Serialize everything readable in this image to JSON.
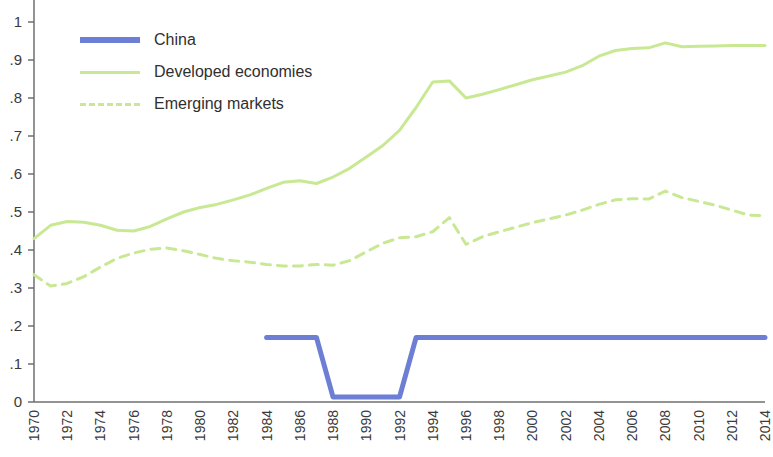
{
  "chart_data": {
    "type": "line",
    "title": "",
    "subtitle": "",
    "xlabel": "",
    "ylabel": "",
    "xlim": [
      1970,
      2014
    ],
    "ylim": [
      0,
      1
    ],
    "grid": false,
    "legend_position": "top-left",
    "y_ticks": [
      "0",
      "0.1",
      "0.2",
      "0.3",
      "0.4",
      "0.5",
      "0.6",
      "0.7",
      "0.8",
      "0.9",
      "1"
    ],
    "y_tick_labels_visible": [
      "0",
      ".1",
      ".2",
      ".3",
      ".4",
      ".5",
      ".6",
      ".7",
      ".8",
      ".9",
      "1"
    ],
    "y_tick_values": [
      0,
      0.1,
      0.2,
      0.3,
      0.4,
      0.5,
      0.6,
      0.7,
      0.8,
      0.9,
      1
    ],
    "x_tick_labels": [
      "1970",
      "1972",
      "1974",
      "1976",
      "1978",
      "1980",
      "1982",
      "1984",
      "1986",
      "1988",
      "1990",
      "1992",
      "1994",
      "1996",
      "1998",
      "2000",
      "2002",
      "2004",
      "2006",
      "2008",
      "2010",
      "2012",
      "2014"
    ],
    "x_tick_values": [
      1970,
      1972,
      1974,
      1976,
      1978,
      1980,
      1982,
      1984,
      1986,
      1988,
      1990,
      1992,
      1994,
      1996,
      1998,
      2000,
      2002,
      2004,
      2006,
      2008,
      2010,
      2012,
      2014
    ],
    "series": [
      {
        "name": "China",
        "color": "#6C7FD4",
        "style": "solid",
        "width": 5,
        "x": [
          1984,
          1985,
          1986,
          1987,
          1988,
          1989,
          1990,
          1991,
          1992,
          1993,
          1994,
          1995,
          1996,
          1997,
          1998,
          1999,
          2000,
          2001,
          2002,
          2003,
          2004,
          2005,
          2006,
          2007,
          2008,
          2009,
          2010,
          2011,
          2012,
          2013,
          2014
        ],
        "values": [
          0.17,
          0.17,
          0.17,
          0.17,
          0.013,
          0.013,
          0.013,
          0.013,
          0.013,
          0.17,
          0.17,
          0.17,
          0.17,
          0.17,
          0.17,
          0.17,
          0.17,
          0.17,
          0.17,
          0.17,
          0.17,
          0.17,
          0.17,
          0.17,
          0.17,
          0.17,
          0.17,
          0.17,
          0.17,
          0.17,
          0.17
        ]
      },
      {
        "name": "Developed economies",
        "color": "#C9E894",
        "style": "solid",
        "width": 3,
        "x": [
          1970,
          1971,
          1972,
          1973,
          1974,
          1975,
          1976,
          1977,
          1978,
          1979,
          1980,
          1981,
          1982,
          1983,
          1984,
          1985,
          1986,
          1987,
          1988,
          1989,
          1990,
          1991,
          1992,
          1993,
          1994,
          1995,
          1996,
          1997,
          1998,
          1999,
          2000,
          2001,
          2002,
          2003,
          2004,
          2005,
          2006,
          2007,
          2008,
          2009,
          2010,
          2011,
          2012,
          2013,
          2014
        ],
        "values": [
          0.43,
          0.465,
          0.475,
          0.473,
          0.465,
          0.452,
          0.45,
          0.462,
          0.482,
          0.5,
          0.512,
          0.52,
          0.532,
          0.545,
          0.562,
          0.578,
          0.582,
          0.575,
          0.592,
          0.615,
          0.645,
          0.675,
          0.715,
          0.775,
          0.842,
          0.845,
          0.8,
          0.81,
          0.822,
          0.835,
          0.848,
          0.858,
          0.868,
          0.885,
          0.91,
          0.925,
          0.93,
          0.932,
          0.945,
          0.935,
          0.936,
          0.937,
          0.938,
          0.938,
          0.938
        ]
      },
      {
        "name": "Emerging markets",
        "color": "#C9E894",
        "style": "dashed",
        "width": 3,
        "x": [
          1970,
          1971,
          1972,
          1973,
          1974,
          1975,
          1976,
          1977,
          1978,
          1979,
          1980,
          1981,
          1982,
          1983,
          1984,
          1985,
          1986,
          1987,
          1988,
          1989,
          1990,
          1991,
          1992,
          1993,
          1994,
          1995,
          1996,
          1997,
          1998,
          1999,
          2000,
          2001,
          2002,
          2003,
          2004,
          2005,
          2006,
          2007,
          2008,
          2009,
          2010,
          2011,
          2012,
          2013,
          2014
        ],
        "values": [
          0.335,
          0.305,
          0.312,
          0.33,
          0.355,
          0.378,
          0.392,
          0.402,
          0.405,
          0.398,
          0.388,
          0.378,
          0.372,
          0.368,
          0.362,
          0.358,
          0.358,
          0.362,
          0.36,
          0.372,
          0.395,
          0.418,
          0.432,
          0.435,
          0.448,
          0.485,
          0.415,
          0.435,
          0.448,
          0.46,
          0.472,
          0.482,
          0.492,
          0.505,
          0.52,
          0.532,
          0.535,
          0.534,
          0.555,
          0.538,
          0.528,
          0.518,
          0.505,
          0.492,
          0.49
        ]
      }
    ],
    "legend": [
      {
        "label": "China",
        "color": "#6C7FD4",
        "style": "solid",
        "thickness": 6
      },
      {
        "label": "Developed economies",
        "color": "#C9E894",
        "style": "solid",
        "thickness": 3
      },
      {
        "label": "Emerging markets",
        "color": "#C9E894",
        "style": "dashed",
        "thickness": 3
      }
    ],
    "axis_color": "#6f6f6f"
  }
}
